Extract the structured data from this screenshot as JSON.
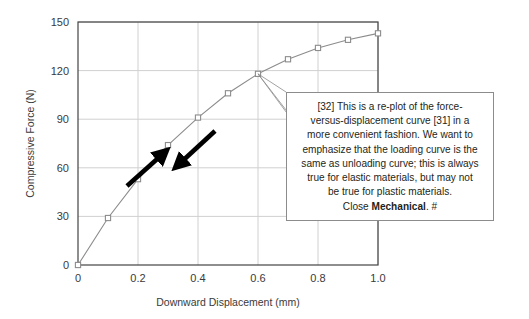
{
  "chart_data": {
    "type": "line",
    "title": "",
    "xlabel": "Downward Displacement (mm)",
    "ylabel": "Compressive Force (N)",
    "xlim": [
      0,
      1.0
    ],
    "ylim": [
      0,
      150
    ],
    "xticks": [
      "0",
      "0.2",
      "0.4",
      "0.6",
      "0.8",
      "1.0"
    ],
    "xtick_values": [
      0,
      0.2,
      0.4,
      0.6,
      0.8,
      1.0
    ],
    "yticks": [
      "0",
      "30",
      "60",
      "90",
      "120",
      "150"
    ],
    "ytick_values": [
      0,
      30,
      60,
      90,
      120,
      150
    ],
    "grid": true,
    "legend": "none",
    "series": [
      {
        "name": "Loading / unloading curve",
        "marker": "square",
        "line_color": "#8c8c8c",
        "marker_color": "#8c8c8c",
        "x": [
          0.0,
          0.1,
          0.2,
          0.3,
          0.4,
          0.5,
          0.6,
          0.7,
          0.8,
          0.9,
          1.0
        ],
        "values": [
          0,
          29,
          53,
          74,
          91,
          106,
          118,
          127,
          134,
          139,
          143
        ]
      }
    ],
    "annotations": [
      {
        "name": "loading-arrow",
        "direction": "up-right",
        "color": "#000000"
      },
      {
        "name": "unloading-arrow",
        "direction": "down-left",
        "color": "#000000"
      }
    ]
  },
  "callout": {
    "line1": "[32] This is a re-plot of the force-",
    "line2": "versus-displacement curve [31] in a",
    "line3": "more convenient fashion.  We want to",
    "line4": "emphasize that the loading curve is the",
    "line5": "same as unloading curve; this is always",
    "line6": "true for elastic materials, but may not",
    "line7": "be true for plastic materials.",
    "close_prefix": "Close ",
    "close_bold": "Mechanical",
    "close_suffix": ". #"
  },
  "colors": {
    "frame": "#444444",
    "grid": "#d0d0d0",
    "curve": "#8c8c8c",
    "arrow": "#000000",
    "text": "#231f20",
    "callout_border": "#8c8c8c",
    "background": "#ffffff"
  }
}
